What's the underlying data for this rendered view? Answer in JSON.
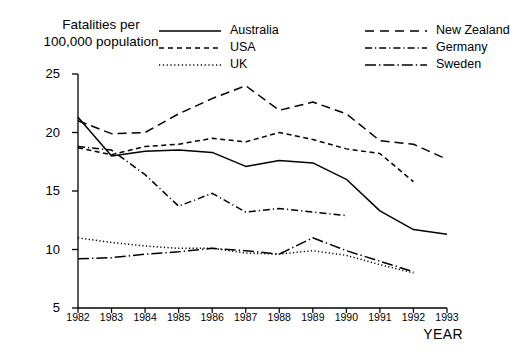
{
  "chart_data": {
    "type": "line",
    "title": "Fatalities per 100,000 population",
    "title_line1": "Fatalities per",
    "title_line2": "100,000 population",
    "xlabel": "YEAR",
    "ylabel": "",
    "categories": [
      1982,
      1983,
      1984,
      1985,
      1986,
      1987,
      1988,
      1989,
      1990,
      1991,
      1992,
      1993
    ],
    "xlim": [
      1982,
      1993
    ],
    "ylim": [
      5,
      25
    ],
    "yticks": [
      5,
      10,
      15,
      20,
      25
    ],
    "xticks": [
      "1982",
      "1983",
      "1984",
      "1985",
      "1986",
      "1987",
      "1988",
      "1989",
      "1990",
      "1991",
      "1992",
      "1993"
    ],
    "grid": false,
    "legend_position": "top-center",
    "series": [
      {
        "name": "Australia",
        "style": "solid",
        "color": "#000000",
        "x": [
          1982,
          1983,
          1984,
          1985,
          1986,
          1987,
          1988,
          1989,
          1990,
          1991,
          1992,
          1993
        ],
        "values": [
          21.3,
          18.0,
          18.4,
          18.5,
          18.3,
          17.1,
          17.6,
          17.4,
          16.0,
          13.3,
          11.7,
          11.3
        ]
      },
      {
        "name": "USA",
        "style": "dashed",
        "color": "#000000",
        "x": [
          1982,
          1983,
          1984,
          1985,
          1986,
          1987,
          1988,
          1989,
          1990,
          1991,
          1992
        ],
        "values": [
          18.7,
          18.1,
          18.8,
          19.0,
          19.5,
          19.2,
          20.0,
          19.4,
          18.6,
          18.2,
          15.8
        ]
      },
      {
        "name": "UK",
        "style": "dotted",
        "color": "#000000",
        "x": [
          1982,
          1983,
          1984,
          1985,
          1986,
          1987,
          1988,
          1989,
          1990,
          1991,
          1992
        ],
        "values": [
          11.0,
          10.6,
          10.3,
          10.1,
          10.1,
          9.7,
          9.6,
          9.9,
          9.5,
          8.7,
          8.0
        ]
      },
      {
        "name": "New Zealand",
        "style": "longdash",
        "color": "#000000",
        "x": [
          1982,
          1983,
          1984,
          1985,
          1986,
          1987,
          1988,
          1989,
          1990,
          1991,
          1992,
          1993
        ],
        "values": [
          21.0,
          19.9,
          20.0,
          21.6,
          22.9,
          24.0,
          21.9,
          22.6,
          21.6,
          19.3,
          19.0,
          17.7
        ]
      },
      {
        "name": "Germany",
        "style": "dashdot-short",
        "color": "#000000",
        "x": [
          1982,
          1983,
          1984,
          1985,
          1986,
          1987,
          1988,
          1989,
          1990
        ],
        "values": [
          18.8,
          18.5,
          16.4,
          13.7,
          14.8,
          13.2,
          13.5,
          13.2,
          12.9
        ]
      },
      {
        "name": "Sweden",
        "style": "dashdot-long",
        "color": "#000000",
        "x": [
          1982,
          1983,
          1984,
          1985,
          1986,
          1987,
          1988,
          1989,
          1990,
          1991,
          1992
        ],
        "values": [
          9.2,
          9.3,
          9.6,
          9.8,
          10.1,
          9.9,
          9.6,
          11.0,
          9.9,
          9.0,
          8.1
        ]
      }
    ]
  },
  "legend": {
    "left_items": [
      {
        "label": "Australia",
        "style": "solid"
      },
      {
        "label": "USA",
        "style": "dashed"
      },
      {
        "label": "UK",
        "style": "dotted"
      }
    ],
    "right_items": [
      {
        "label": "New Zealand",
        "style": "longdash"
      },
      {
        "label": "Germany",
        "style": "dashdot-short"
      },
      {
        "label": "Sweden",
        "style": "dashdot-long"
      }
    ]
  },
  "axes": {
    "x_axis_title": "YEAR"
  },
  "colors": {
    "ink": "#000000",
    "background": "#ffffff"
  }
}
